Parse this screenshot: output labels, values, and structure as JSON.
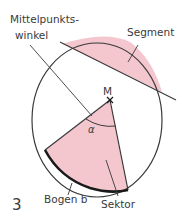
{
  "figure": {
    "number": "3",
    "labels": {
      "central_angle_line1": "Mittelpunkts-",
      "central_angle_line2": "winkel",
      "segment": "Segment",
      "center": "M",
      "angle": "α",
      "arc": "Bogen b",
      "sector": "Sektor"
    },
    "colors": {
      "fill": "#f4c6cd",
      "stroke": "#3a3a3a",
      "arc_stroke": "#1a1a1a",
      "background": "#ffffff"
    }
  }
}
